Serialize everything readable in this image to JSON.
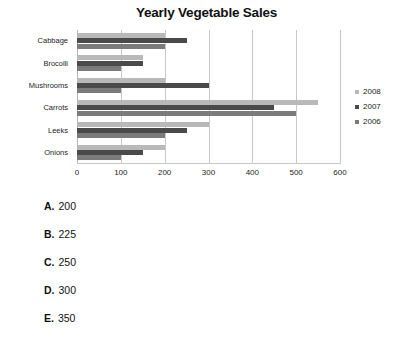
{
  "chart_data": {
    "type": "bar",
    "orientation": "horizontal",
    "title": "Yearly Vegetable Sales",
    "xlabel": "",
    "ylabel": "",
    "xlim": [
      0,
      600
    ],
    "xticks": [
      0,
      100,
      200,
      300,
      400,
      500,
      600
    ],
    "xtick_labels": [
      "0",
      "100",
      "200",
      "300",
      "400",
      "500",
      "600"
    ],
    "grid": true,
    "grid_axis": "x",
    "legend_position": "right",
    "categories": [
      "Cabbage",
      "Brocolli",
      "Mushrooms",
      "Carrots",
      "Leeks",
      "Onions"
    ],
    "series": [
      {
        "name": "2008",
        "color": "#b9b9b9",
        "values": [
          200,
          150,
          200,
          550,
          300,
          200
        ]
      },
      {
        "name": "2007",
        "color": "#4a4a4a",
        "values": [
          250,
          150,
          300,
          450,
          250,
          150
        ]
      },
      {
        "name": "2006",
        "color": "#7b7b7b",
        "values": [
          200,
          100,
          100,
          500,
          200,
          100
        ]
      }
    ]
  },
  "options": [
    {
      "letter": "A.",
      "value": "200"
    },
    {
      "letter": "B.",
      "value": "225"
    },
    {
      "letter": "C.",
      "value": "250"
    },
    {
      "letter": "D.",
      "value": "300"
    },
    {
      "letter": "E.",
      "value": "350"
    }
  ]
}
